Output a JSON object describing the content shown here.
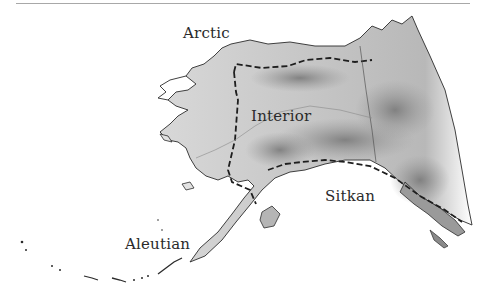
{
  "map": {
    "subject": "Alaska shaded relief map",
    "regions": [
      {
        "name": "Arctic",
        "x": 183,
        "y": 24
      },
      {
        "name": "Interior",
        "x": 251,
        "y": 107
      },
      {
        "name": "Sitkan",
        "x": 325,
        "y": 187
      },
      {
        "name": "Aleutian",
        "x": 125,
        "y": 235
      }
    ],
    "colors": {
      "land": "#e2e2e2",
      "relief_dark": "#8a8a8a",
      "coastline": "#2b2b2b",
      "boundary": "#1e1e1e",
      "rule": "#a8a8a8"
    }
  }
}
